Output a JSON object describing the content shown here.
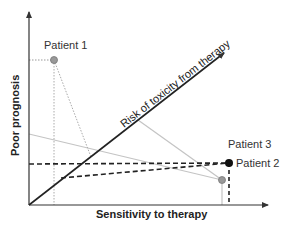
{
  "diagram": {
    "axes": {
      "x_label": "Sensitivity to therapy",
      "y_label": "Poor prognosis",
      "diagonal_label": "Risk of toxicity from therapy"
    },
    "patients": [
      {
        "label": "Patient 1",
        "color": "#999999"
      },
      {
        "label": "Patient 3",
        "color": "#999999"
      },
      {
        "label": "Patient 2",
        "color": "#111111"
      }
    ],
    "colors": {
      "axis": "#333333",
      "gray_line": "#bbbbbb",
      "dotted_line": "#aaaaaa",
      "dashed_line": "#222222"
    }
  }
}
